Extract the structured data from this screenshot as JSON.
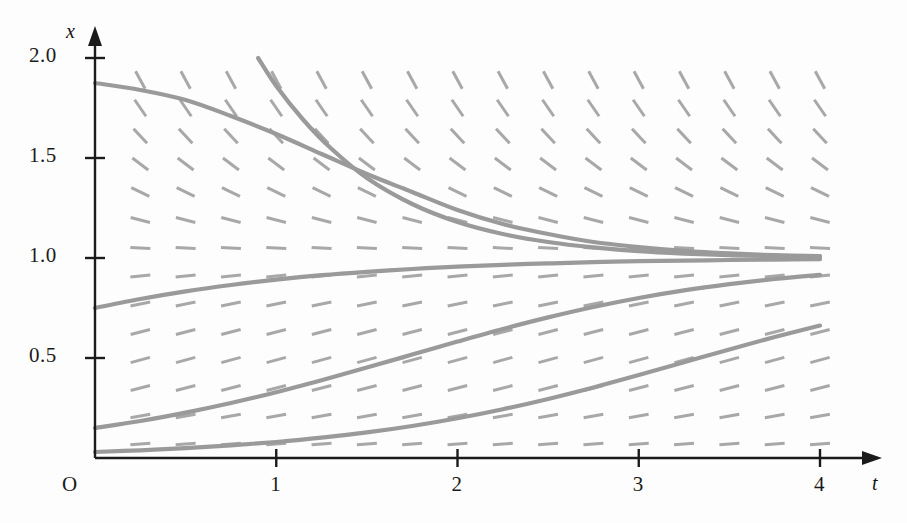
{
  "figure": {
    "background": "#fdfdfd",
    "curve_color": "#9a9a9a",
    "slope_color": "#a8a8a8",
    "axis_color": "#1b1b1b",
    "origin_label": "O",
    "xaxis_name": "t",
    "yaxis_name": "x"
  },
  "chart_data": {
    "type": "line",
    "title": "",
    "xlabel": "t",
    "ylabel": "x",
    "xlim": [
      0,
      4.25
    ],
    "ylim": [
      0,
      2.1
    ],
    "grid": false,
    "legend": "none",
    "xticks": [
      1,
      2,
      3,
      4
    ],
    "xtick_labels": [
      "1",
      "2",
      "3",
      "4"
    ],
    "yticks": [
      0.5,
      1.0,
      1.5,
      2.0
    ],
    "ytick_labels": [
      "0.5",
      "1.0",
      "1.5",
      "2.0"
    ],
    "origin_label": "O",
    "equilibrium": 1.0,
    "slope_field": {
      "formula": "dx/dt = x(1 - x)",
      "t_samples": [
        0.25,
        0.5,
        0.75,
        1.0,
        1.25,
        1.5,
        1.75,
        2.0,
        2.25,
        2.5,
        2.75,
        3.0,
        3.25,
        3.5,
        3.75,
        4.0
      ],
      "x_samples": [
        0.07,
        0.21,
        0.35,
        0.49,
        0.63,
        0.77,
        0.91,
        1.05,
        1.19,
        1.33,
        1.47,
        1.61,
        1.75,
        1.89
      ],
      "dash_length_px": 20
    },
    "series": [
      {
        "name": "solution-x0-1.875",
        "x0": 1.875,
        "t_start": 0.0,
        "points": [
          [
            0,
            1.875
          ],
          [
            0.25,
            1.84
          ],
          [
            0.5,
            1.79
          ],
          [
            0.75,
            1.71
          ],
          [
            1,
            1.62
          ],
          [
            1.25,
            1.52
          ],
          [
            1.5,
            1.42
          ],
          [
            1.75,
            1.33
          ],
          [
            2,
            1.24
          ],
          [
            2.25,
            1.17
          ],
          [
            2.5,
            1.12
          ],
          [
            2.75,
            1.08
          ],
          [
            3,
            1.055
          ],
          [
            3.25,
            1.036
          ],
          [
            3.5,
            1.023
          ],
          [
            3.75,
            1.014
          ],
          [
            4,
            1.009
          ]
        ]
      },
      {
        "name": "solution-entering-top",
        "x0": 2.0,
        "t_start": 0.9,
        "points": [
          [
            0.9,
            2.0
          ],
          [
            1.0,
            1.86
          ],
          [
            1.15,
            1.69
          ],
          [
            1.3,
            1.55
          ],
          [
            1.5,
            1.4
          ],
          [
            1.75,
            1.27
          ],
          [
            2,
            1.18
          ],
          [
            2.25,
            1.12
          ],
          [
            2.5,
            1.08
          ],
          [
            2.75,
            1.053
          ],
          [
            3,
            1.034
          ],
          [
            3.25,
            1.022
          ],
          [
            3.5,
            1.014
          ],
          [
            3.75,
            1.009
          ],
          [
            4,
            1.006
          ]
        ]
      },
      {
        "name": "solution-x0-0.75",
        "x0": 0.75,
        "t_start": 0.0,
        "points": [
          [
            0,
            0.75
          ],
          [
            0.25,
            0.795
          ],
          [
            0.5,
            0.833
          ],
          [
            0.75,
            0.865
          ],
          [
            1,
            0.892
          ],
          [
            1.25,
            0.914
          ],
          [
            1.5,
            0.931
          ],
          [
            1.75,
            0.945
          ],
          [
            2,
            0.957
          ],
          [
            2.25,
            0.966
          ],
          [
            2.5,
            0.973
          ],
          [
            2.75,
            0.979
          ],
          [
            3,
            0.984
          ],
          [
            3.25,
            0.987
          ],
          [
            3.5,
            0.99
          ],
          [
            3.75,
            0.992
          ],
          [
            4,
            0.994
          ]
        ]
      },
      {
        "name": "solution-x0-0.15",
        "x0": 0.15,
        "t_start": 0.0,
        "points": [
          [
            0,
            0.15
          ],
          [
            0.25,
            0.185
          ],
          [
            0.5,
            0.227
          ],
          [
            0.75,
            0.275
          ],
          [
            1,
            0.329
          ],
          [
            1.25,
            0.389
          ],
          [
            1.5,
            0.452
          ],
          [
            1.75,
            0.517
          ],
          [
            2,
            0.582
          ],
          [
            2.25,
            0.645
          ],
          [
            2.5,
            0.703
          ],
          [
            2.75,
            0.755
          ],
          [
            3,
            0.8
          ],
          [
            3.25,
            0.838
          ],
          [
            3.5,
            0.869
          ],
          [
            3.75,
            0.895
          ],
          [
            4,
            0.916
          ]
        ]
      },
      {
        "name": "solution-x0-0.03",
        "x0": 0.03,
        "t_start": 0.0,
        "points": [
          [
            0,
            0.03
          ],
          [
            0.25,
            0.0385
          ],
          [
            0.5,
            0.0493
          ],
          [
            0.75,
            0.0629
          ],
          [
            1,
            0.0801
          ],
          [
            1.25,
            0.1015
          ],
          [
            1.5,
            0.1279
          ],
          [
            1.75,
            0.1601
          ],
          [
            2,
            0.1986
          ],
          [
            2.25,
            0.2437
          ],
          [
            2.5,
            0.2953
          ],
          [
            2.75,
            0.3527
          ],
          [
            3,
            0.4145
          ],
          [
            3.25,
            0.4787
          ],
          [
            3.5,
            0.543
          ],
          [
            3.75,
            0.6049
          ],
          [
            4,
            0.6624
          ]
        ]
      }
    ]
  }
}
